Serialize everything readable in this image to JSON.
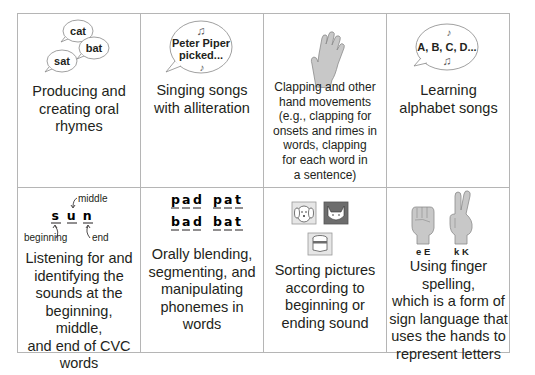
{
  "cells": [
    {
      "id": "oral-rhymes",
      "bubbles": [
        "cat",
        "bat",
        "sat"
      ],
      "caption_lines": [
        "Producing and",
        "creating oral",
        "rhymes"
      ]
    },
    {
      "id": "alliteration-songs",
      "bubble_lines": [
        "Peter Piper",
        "picked..."
      ],
      "caption_lines": [
        "Singing songs",
        "with alliteration"
      ]
    },
    {
      "id": "clapping",
      "caption_lines": [
        "Clapping and other",
        "hand movements",
        "(e.g., clapping for",
        "onsets and rimes in",
        "words, clapping",
        "for each word in",
        "a sentence)"
      ]
    },
    {
      "id": "alphabet-songs",
      "bubble_text": "A, B, C, D...",
      "caption_lines": [
        "Learning",
        "alphabet songs"
      ]
    },
    {
      "id": "cvc-sounds",
      "word_letters": [
        "s",
        "u",
        "n"
      ],
      "labels": {
        "beginning": "beginning",
        "middle": "middle",
        "end": "end"
      },
      "caption_lines": [
        "Listening for and",
        "identifying the",
        "sounds at the",
        "beginning, middle,",
        "and end of CVC",
        "words"
      ]
    },
    {
      "id": "phonemes",
      "words": [
        [
          "p",
          "a",
          "d"
        ],
        [
          "p",
          "a",
          "t"
        ],
        [
          "b",
          "a",
          "d"
        ],
        [
          "b",
          "a",
          "t"
        ]
      ],
      "caption_lines": [
        "Orally blending,",
        "segmenting, and",
        "manipulating",
        "phonemes in",
        "words"
      ]
    },
    {
      "id": "sorting-pictures",
      "pictures": [
        "dog",
        "cat",
        "drum"
      ],
      "caption_lines": [
        "Sorting pictures",
        "according to",
        "beginning or",
        "ending sound"
      ]
    },
    {
      "id": "finger-spelling",
      "hand_labels": [
        "e E",
        "k K"
      ],
      "caption_lines": [
        "Using finger spelling,",
        "which is a form of",
        "sign language that",
        "uses the hands to",
        "represent letters"
      ]
    }
  ],
  "colors": {
    "border": "#b5b5b5",
    "text": "#231f20",
    "hand_fill": "#c8c8c8",
    "hand_stroke": "#8a8a8a",
    "icon_gray": "#6d6d6d"
  }
}
